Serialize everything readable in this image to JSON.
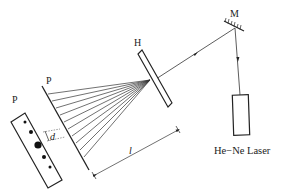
{
  "diagram": {
    "title": "",
    "labels": {
      "mirror": "M",
      "hologram": "H",
      "screen_line": "P",
      "screen_pattern": "P",
      "spacing": "d",
      "distance": "l",
      "laser": "He−Ne Laser"
    },
    "components": [
      {
        "id": "laser",
        "name": "He-Ne Laser",
        "shape": "rectangle"
      },
      {
        "id": "mirror",
        "name": "M",
        "shape": "hatched-mirror"
      },
      {
        "id": "hologram",
        "name": "H",
        "shape": "thin-plate"
      },
      {
        "id": "screen",
        "name": "P",
        "shape": "line"
      },
      {
        "id": "pattern",
        "name": "P",
        "shape": "rectangle-with-dots"
      }
    ],
    "fan_rays": 10,
    "pattern_dots": [
      {
        "size": "small"
      },
      {
        "size": "medium"
      },
      {
        "size": "large"
      },
      {
        "size": "medium"
      },
      {
        "size": "small"
      }
    ],
    "colors": {
      "line": "#222222",
      "background": "#ffffff"
    }
  }
}
